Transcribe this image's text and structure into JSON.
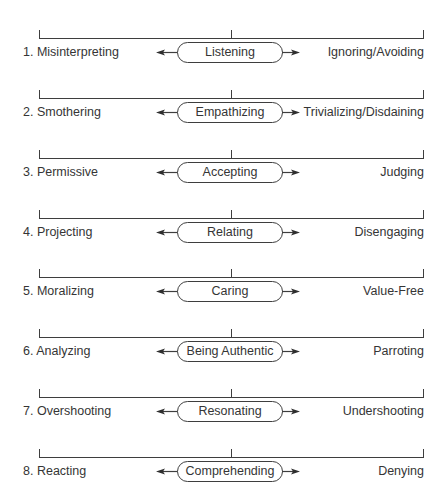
{
  "colors": {
    "line": "#3e3e3e",
    "text": "#353535",
    "background": "#ffffff"
  },
  "rows": [
    {
      "number": "1.",
      "left": "Misinterpreting",
      "center": "Listening",
      "right": "Ignoring/Avoiding"
    },
    {
      "number": "2.",
      "left": "Smothering",
      "center": "Empathizing",
      "right": "Trivializing/Disdaining"
    },
    {
      "number": "3.",
      "left": "Permissive",
      "center": "Accepting",
      "right": "Judging"
    },
    {
      "number": "4.",
      "left": "Projecting",
      "center": "Relating",
      "right": "Disengaging"
    },
    {
      "number": "5.",
      "left": "Moralizing",
      "center": "Caring",
      "right": "Value-Free"
    },
    {
      "number": "6.",
      "left": "Analyzing",
      "center": "Being Authentic",
      "right": "Parroting"
    },
    {
      "number": "7.",
      "left": "Overshooting",
      "center": "Resonating",
      "right": "Undershooting"
    },
    {
      "number": "8.",
      "left": "Reacting",
      "center": "Comprehending",
      "right": "Denying"
    }
  ]
}
